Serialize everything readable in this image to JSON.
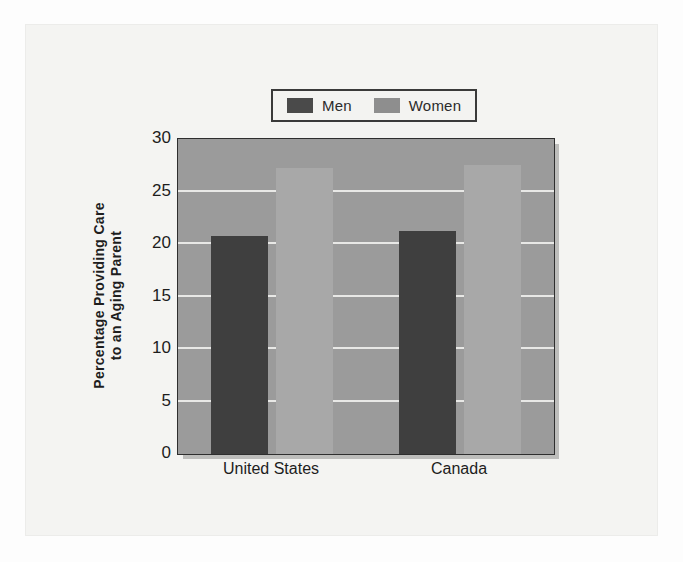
{
  "chart_data": {
    "type": "bar",
    "title": "",
    "subtitle": "",
    "xlabel": "",
    "ylabel": "Percentage Providing Care to an Aging Parent",
    "ylabel_lines": [
      "Percentage Providing Care",
      "to an Aging Parent"
    ],
    "categories": [
      "United States",
      "Canada"
    ],
    "series": [
      {
        "name": "Men",
        "values": [
          20.8,
          21.2
        ],
        "color": "#3f3f3f"
      },
      {
        "name": "Women",
        "values": [
          27.2,
          27.5
        ],
        "color": "#a8a8a8"
      }
    ],
    "ylim": [
      0,
      30
    ],
    "ytick_values": [
      0,
      5,
      10,
      15,
      20,
      25,
      30
    ],
    "ytick_labels": [
      "0",
      "5",
      "10",
      "15",
      "20",
      "25",
      "30"
    ],
    "grid": true,
    "grid_axis": "y",
    "legend_position": "top-center",
    "legend_entries": [
      "Men",
      "Women"
    ]
  },
  "legend": {
    "entries": [
      {
        "label": "Men",
        "swatch": "men-swatch"
      },
      {
        "label": "Women",
        "swatch": "women-swatch"
      }
    ]
  },
  "colors": {
    "plot_background": "#9b9b9b",
    "page_background": "#f4f4f2",
    "gridline": "#e8e8e6",
    "axis": "#2e2e2e",
    "men": "#3f3f3f",
    "women": "#a8a8a8",
    "legend_border": "#3a3a3a",
    "text": "#1d1d1d"
  }
}
